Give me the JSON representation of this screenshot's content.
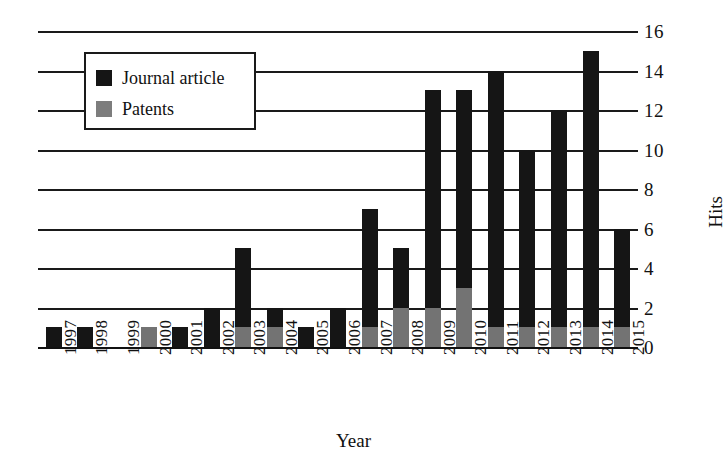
{
  "chart_data": {
    "type": "bar",
    "subtype": "stacked-vertical",
    "title": "",
    "xlabel": "Year",
    "ylabel": "Hits",
    "categories": [
      "1997",
      "1998",
      "1999",
      "2000",
      "2001",
      "2002",
      "2003",
      "2004",
      "2005",
      "2006",
      "2007",
      "2008",
      "2009",
      "2010",
      "2011",
      "2012",
      "2013",
      "2014",
      "2015"
    ],
    "series": [
      {
        "name": "Patents",
        "color": "#737373",
        "values": [
          0,
          0,
          0,
          1,
          0,
          0,
          1,
          1,
          0,
          0,
          1,
          2,
          2,
          3,
          1,
          1,
          1,
          1,
          1
        ]
      },
      {
        "name": "Journal article",
        "color": "#151515",
        "values": [
          1,
          1,
          0,
          0,
          1,
          2,
          4,
          1,
          1,
          2,
          6,
          3,
          11,
          10,
          13,
          9,
          11,
          14,
          5
        ]
      }
    ],
    "totals": [
      1,
      1,
      0,
      1,
      1,
      2,
      5,
      2,
      1,
      2,
      7,
      5,
      13,
      13,
      14,
      10,
      12,
      15,
      6
    ],
    "ylim": [
      0,
      16
    ],
    "yticks": [
      "0",
      "2",
      "4",
      "6",
      "8",
      "10",
      "12",
      "14",
      "16"
    ],
    "grid": "horizontal",
    "legend_position": "upper-left-inside"
  },
  "legend": {
    "entries": [
      {
        "label": "Journal article",
        "swatch": "black"
      },
      {
        "label": "Patents",
        "swatch": "gray"
      }
    ]
  },
  "axes": {
    "x_title": "Year",
    "y_title": "Hits"
  }
}
